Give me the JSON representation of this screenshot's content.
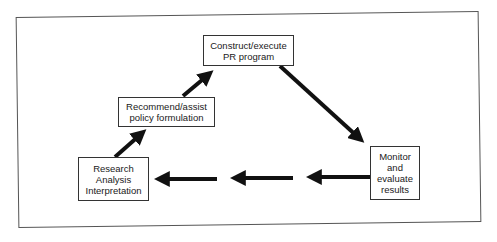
{
  "diagram": {
    "type": "cycle",
    "nodes": [
      {
        "id": "construct",
        "lines": [
          "Construct/execute",
          "PR program"
        ]
      },
      {
        "id": "recommend",
        "lines": [
          "Recommend/assist",
          "policy formulation"
        ]
      },
      {
        "id": "research",
        "lines": [
          "Research",
          "Analysis",
          "Interpretation"
        ]
      },
      {
        "id": "monitor",
        "lines": [
          "Monitor",
          "and",
          "evaluate",
          "results"
        ]
      }
    ],
    "edges": [
      {
        "from": "research",
        "to": "recommend"
      },
      {
        "from": "recommend",
        "to": "construct"
      },
      {
        "from": "construct",
        "to": "monitor"
      },
      {
        "from": "monitor",
        "to": "research",
        "segments": 3
      }
    ],
    "colors": {
      "arrow": "#111111",
      "box_border": "#333333",
      "frame": "#555555",
      "background": "#ffffff"
    }
  }
}
